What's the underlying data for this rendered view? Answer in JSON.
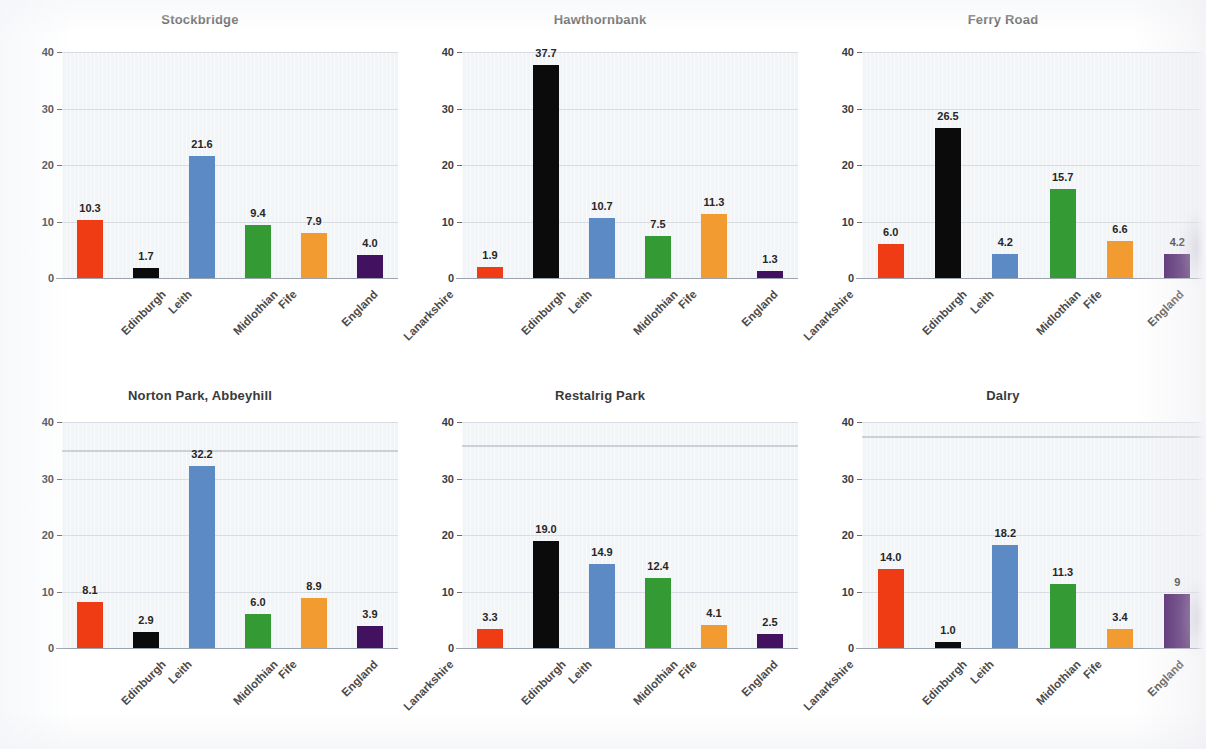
{
  "figure": {
    "layout": "3 columns x 2 rows small multiples",
    "y_ticks": [
      0,
      10,
      20,
      30,
      40
    ],
    "ylim": [
      0,
      40
    ],
    "categories": [
      "Edinburgh",
      "Leith",
      "Midlothian",
      "Fife",
      "England",
      "Lanarkshire"
    ],
    "series_colors": {
      "Edinburgh": "#f03c14",
      "Leith": "#0b0b0b",
      "Midlothian": "#5b8ac4",
      "Fife": "#349a33",
      "England": "#f29b30",
      "Lanarkshire": "#421160"
    }
  },
  "chart_data": [
    {
      "type": "bar",
      "title": "Stockbridge",
      "xlabel": "",
      "ylabel": "",
      "ylim": [
        0,
        40
      ],
      "yticks": [
        0,
        10,
        20,
        30,
        40
      ],
      "grid": true,
      "legend": "none",
      "categories": [
        "Edinburgh",
        "Leith",
        "Midlothian",
        "Fife",
        "England",
        "Lanarkshire"
      ],
      "values": [
        10.3,
        1.7,
        21.6,
        9.4,
        7.9,
        4.0
      ],
      "labels": [
        "10.3",
        "1.7",
        "21.6",
        "9.4",
        "7.9",
        "4.0"
      ]
    },
    {
      "type": "bar",
      "title": "Hawthornbank",
      "xlabel": "",
      "ylabel": "",
      "ylim": [
        0,
        40
      ],
      "yticks": [
        0,
        10,
        20,
        30,
        40
      ],
      "grid": true,
      "legend": "none",
      "categories": [
        "Edinburgh",
        "Leith",
        "Midlothian",
        "Fife",
        "England",
        "Lanarkshire"
      ],
      "values": [
        1.9,
        37.7,
        10.7,
        7.5,
        11.3,
        1.3
      ],
      "labels": [
        "1.9",
        "37.7",
        "10.7",
        "7.5",
        "11.3",
        "1.3"
      ]
    },
    {
      "type": "bar",
      "title": "Ferry Road",
      "xlabel": "",
      "ylabel": "",
      "ylim": [
        0,
        40
      ],
      "yticks": [
        0,
        10,
        20,
        30,
        40
      ],
      "grid": true,
      "legend": "none",
      "categories": [
        "Edinburgh",
        "Leith",
        "Midlothian",
        "Fife",
        "England",
        "Lanarkshire"
      ],
      "values": [
        6.0,
        26.5,
        4.2,
        15.7,
        6.6,
        4.2
      ],
      "labels": [
        "6.0",
        "26.5",
        "4.2",
        "15.7",
        "6.6",
        "4.2"
      ]
    },
    {
      "type": "bar",
      "title": "Norton Park, Abbeyhill",
      "xlabel": "",
      "ylabel": "",
      "ylim": [
        0,
        40
      ],
      "yticks": [
        0,
        10,
        20,
        30,
        40
      ],
      "grid": true,
      "legend": "none",
      "categories": [
        "Edinburgh",
        "Leith",
        "Midlothian",
        "Fife",
        "England",
        "Lanarkshire"
      ],
      "values": [
        8.1,
        2.9,
        32.2,
        6.0,
        8.9,
        3.9
      ],
      "labels": [
        "8.1",
        "2.9",
        "32.2",
        "6.0",
        "8.9",
        "3.9"
      ]
    },
    {
      "type": "bar",
      "title": "Restalrig Park",
      "xlabel": "",
      "ylabel": "",
      "ylim": [
        0,
        40
      ],
      "yticks": [
        0,
        10,
        20,
        30,
        40
      ],
      "grid": true,
      "legend": "none",
      "categories": [
        "Edinburgh",
        "Leith",
        "Midlothian",
        "Fife",
        "England",
        "Lanarkshire"
      ],
      "values": [
        3.3,
        19.0,
        14.9,
        12.4,
        4.1,
        2.5
      ],
      "labels": [
        "3.3",
        "19.0",
        "14.9",
        "12.4",
        "4.1",
        "2.5"
      ]
    },
    {
      "type": "bar",
      "title": "Dalry",
      "xlabel": "",
      "ylabel": "",
      "ylim": [
        0,
        40
      ],
      "yticks": [
        0,
        10,
        20,
        30,
        40
      ],
      "grid": true,
      "legend": "none",
      "categories": [
        "Edinburgh",
        "Leith",
        "Midlothian",
        "Fife",
        "England",
        "Lanarkshire"
      ],
      "values": [
        14.0,
        1.0,
        18.2,
        11.3,
        3.4,
        9.6
      ],
      "labels": [
        "14.0",
        "1.0",
        "18.2",
        "11.3",
        "3.4",
        "9"
      ]
    }
  ]
}
